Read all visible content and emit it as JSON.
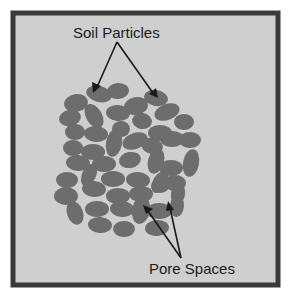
{
  "diagram": {
    "labels": {
      "top": "Soil Particles",
      "bottom": "Pore Spaces"
    },
    "colors": {
      "frame": "#3a3a3a",
      "background": "#cfcfcf",
      "particle": "#6d6d6d",
      "arrow": "#1a1a1a",
      "text": "#1c1c1c"
    },
    "annotations": [
      {
        "label": "Soil Particles",
        "points_to": [
          "particle",
          "particle"
        ]
      },
      {
        "label": "Pore Spaces",
        "points_to": [
          "gap",
          "gap"
        ]
      }
    ]
  }
}
